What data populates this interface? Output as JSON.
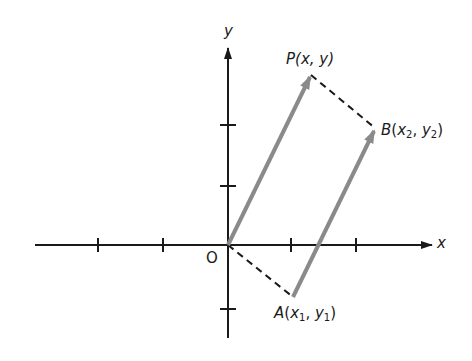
{
  "diagram": {
    "axes": {
      "x_label": "x",
      "y_label": "y",
      "origin_label": "O",
      "x_ticks": [
        -2,
        -1,
        1,
        2
      ],
      "y_ticks": [
        -1,
        1,
        2
      ]
    },
    "points": {
      "P": {
        "label_name": "P",
        "label_coords": "(x, y)"
      },
      "B": {
        "label_name": "B",
        "label_x": "x",
        "label_x_sub": "2",
        "label_y": "y",
        "label_y_sub": "2"
      },
      "A": {
        "label_name": "A",
        "label_x": "x",
        "label_x_sub": "1",
        "label_y": "y",
        "label_y_sub": "1"
      }
    },
    "vectors": [
      {
        "from": "O",
        "to": "P",
        "style": "solid-gray-arrow"
      },
      {
        "from": "A",
        "to": "B",
        "style": "solid-gray-arrow"
      }
    ],
    "dashed_segments": [
      {
        "from": "O",
        "to": "A"
      },
      {
        "from": "P",
        "to": "B"
      }
    ],
    "colors": {
      "axis": "#1a1a1a",
      "vector": "#8a8a8a",
      "dashed": "#1a1a1a"
    }
  }
}
